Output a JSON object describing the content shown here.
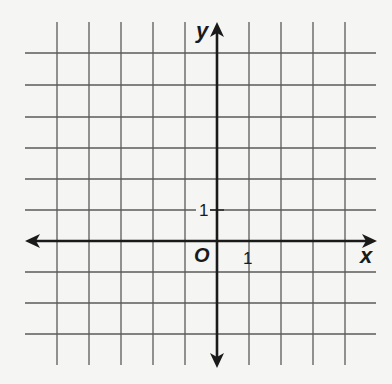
{
  "diagram": {
    "type": "coordinate-grid",
    "x_axis_label": "x",
    "y_axis_label": "y",
    "origin_label": "O",
    "x_tick_label": "1",
    "y_tick_label": "1",
    "grid_columns_left_of_origin": 5,
    "grid_columns_right_of_origin": 4,
    "grid_rows_above_origin": 6,
    "grid_rows_below_origin": 3,
    "colors": {
      "background": "#f5f5f3",
      "grid": "#555555",
      "axis": "#1a1a1a"
    }
  }
}
